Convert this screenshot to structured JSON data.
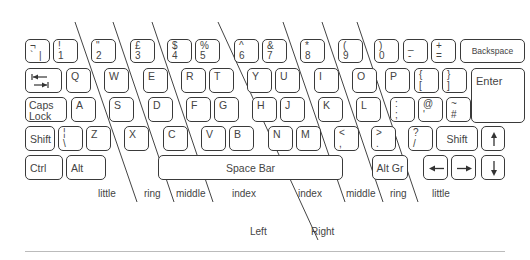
{
  "keys": {
    "row1": [
      {
        "id": "backtick",
        "top": "¬",
        "bottom": "`  |"
      },
      {
        "id": "1",
        "top": "!",
        "bottom": "1"
      },
      {
        "id": "2",
        "top": "\"",
        "bottom": "2"
      },
      {
        "id": "3",
        "top": "£",
        "bottom": "3"
      },
      {
        "id": "4",
        "top": "$",
        "bottom": "4"
      },
      {
        "id": "5",
        "top": "%",
        "bottom": "5"
      },
      {
        "id": "6",
        "top": "^",
        "bottom": "6"
      },
      {
        "id": "7",
        "top": "&",
        "bottom": "7"
      },
      {
        "id": "8",
        "top": "*",
        "bottom": "8"
      },
      {
        "id": "9",
        "top": "(",
        "bottom": "9"
      },
      {
        "id": "0",
        "top": ")",
        "bottom": "0"
      },
      {
        "id": "minus",
        "top": "_",
        "bottom": "-"
      },
      {
        "id": "equals",
        "top": "+",
        "bottom": "="
      },
      {
        "id": "backspace",
        "label": "Backspace"
      }
    ],
    "row2": [
      {
        "id": "tab",
        "icon": "tab-arrows-icon"
      },
      {
        "id": "q",
        "label": "Q"
      },
      {
        "id": "w",
        "label": "W"
      },
      {
        "id": "e",
        "label": "E"
      },
      {
        "id": "r",
        "label": "R"
      },
      {
        "id": "t",
        "label": "T"
      },
      {
        "id": "y",
        "label": "Y"
      },
      {
        "id": "u",
        "label": "U"
      },
      {
        "id": "i",
        "label": "I"
      },
      {
        "id": "o",
        "label": "O"
      },
      {
        "id": "p",
        "label": "P"
      },
      {
        "id": "lbrace",
        "top": "{",
        "bottom": "["
      },
      {
        "id": "rbrace",
        "top": "}",
        "bottom": "]"
      },
      {
        "id": "enter",
        "label": "Enter"
      }
    ],
    "row3": [
      {
        "id": "capslock",
        "line1": "Caps",
        "line2": "Lock"
      },
      {
        "id": "a",
        "label": "A"
      },
      {
        "id": "s",
        "label": "S"
      },
      {
        "id": "d",
        "label": "D"
      },
      {
        "id": "f",
        "label": "F"
      },
      {
        "id": "g",
        "label": "G"
      },
      {
        "id": "h",
        "label": "H"
      },
      {
        "id": "j",
        "label": "J"
      },
      {
        "id": "k",
        "label": "K"
      },
      {
        "id": "l",
        "label": "L"
      },
      {
        "id": "semicolon",
        "top": ":",
        "bottom": ";"
      },
      {
        "id": "quote",
        "top": "@",
        "bottom": "'"
      },
      {
        "id": "hash",
        "top": "~",
        "bottom": "#"
      }
    ],
    "row4": [
      {
        "id": "lshift",
        "label": "Shift"
      },
      {
        "id": "backslash",
        "top": "¦",
        "bottom": "\\"
      },
      {
        "id": "z",
        "label": "Z"
      },
      {
        "id": "x",
        "label": "X"
      },
      {
        "id": "c",
        "label": "C"
      },
      {
        "id": "v",
        "label": "V"
      },
      {
        "id": "b",
        "label": "B"
      },
      {
        "id": "n",
        "label": "N"
      },
      {
        "id": "m",
        "label": "M"
      },
      {
        "id": "comma",
        "top": "<",
        "bottom": ","
      },
      {
        "id": "period",
        "top": ">",
        "bottom": "."
      },
      {
        "id": "slash",
        "top": "?",
        "bottom": "/"
      },
      {
        "id": "rshift",
        "label": "Shift"
      },
      {
        "id": "up",
        "icon": "arrow-up-icon"
      }
    ],
    "row5": [
      {
        "id": "ctrl",
        "label": "Ctrl"
      },
      {
        "id": "alt",
        "label": "Alt"
      },
      {
        "id": "space",
        "label": "Space Bar"
      },
      {
        "id": "altgr",
        "label": "Alt Gr"
      },
      {
        "id": "left",
        "icon": "arrow-left-icon"
      },
      {
        "id": "right",
        "icon": "arrow-right-icon"
      },
      {
        "id": "down",
        "icon": "arrow-down-icon"
      }
    ]
  },
  "finger_labels": {
    "left_little": "little",
    "left_ring": "ring",
    "left_middle": "middle",
    "left_index": "index",
    "right_index": "index",
    "right_middle": "middle",
    "right_ring": "ring",
    "right_little": "little"
  },
  "hand_labels": {
    "left": "Left",
    "right": "Right"
  }
}
